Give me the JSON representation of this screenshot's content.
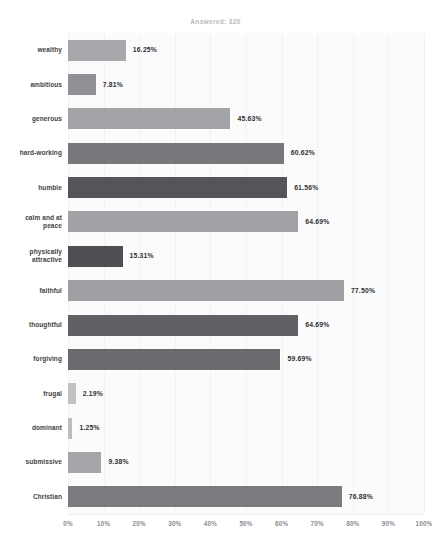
{
  "header": {
    "title": "",
    "answered_label": "Answered: 320"
  },
  "chart_data": {
    "type": "bar",
    "orientation": "horizontal",
    "title": "",
    "subtitle": "Answered: 320",
    "xlabel": "",
    "ylabel": "",
    "xlim": [
      0,
      100
    ],
    "grid": true,
    "legend": "none",
    "categories": [
      "wealthy",
      "ambitious",
      "generous",
      "hard-working",
      "humble",
      "calm and at peace",
      "physically attractive",
      "faithful",
      "thoughtful",
      "forgiving",
      "frugal",
      "dominant",
      "submissive",
      "Christian"
    ],
    "values": [
      16.25,
      7.81,
      45.63,
      60.62,
      61.56,
      64.69,
      15.31,
      77.5,
      64.69,
      59.69,
      2.19,
      1.25,
      9.38,
      76.88
    ],
    "value_labels": [
      "16.25%",
      "7.81%",
      "45.63%",
      "60.62%",
      "61.56%",
      "64.69%",
      "15.31%",
      "77.50%",
      "64.69%",
      "59.69%",
      "2.19%",
      "1.25%",
      "9.38%",
      "76.88%"
    ],
    "bar_colors": [
      "#a8a8ac",
      "#8f8f94",
      "#a4a4a8",
      "#77777c",
      "#555559",
      "#a2a2a6",
      "#4f4f53",
      "#a0a0a4",
      "#606065",
      "#6a6a6f",
      "#c2c2c6",
      "#bdbdc1",
      "#a6a6aa",
      "#7a7a7f"
    ],
    "xticks": [
      0,
      10,
      20,
      30,
      40,
      50,
      60,
      70,
      80,
      90,
      100
    ],
    "xtick_labels": [
      "0%",
      "10%",
      "20%",
      "30%",
      "40%",
      "50%",
      "60%",
      "70%",
      "80%",
      "90%",
      "100%"
    ]
  },
  "colors": {
    "plot_background": "#fbfbfc",
    "gridline": "#f2f2f4",
    "label_text": "#3f3f42",
    "tick_text": "#8c8c92",
    "value_text": "#2f2f33"
  }
}
